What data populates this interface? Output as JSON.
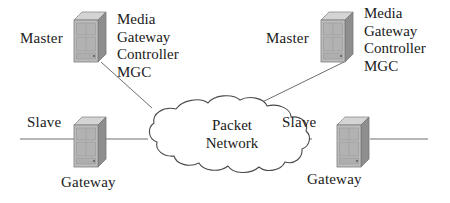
{
  "diagram": {
    "background": "#ffffff",
    "line_color": "#6b6b6b",
    "text_color": "#202020",
    "device_color_front": "#b9b9b9",
    "device_color_side": "#8f8f8f",
    "device_color_top": "#d6d6d6"
  },
  "nodes": {
    "mgc_left": {
      "role_label": "Master",
      "name_lines": [
        "Media",
        "Gateway",
        "Controller",
        "MGC"
      ],
      "icon": "server-cabinet-icon"
    },
    "mgc_right": {
      "role_label": "Master",
      "name_lines": [
        "Media",
        "Gateway",
        "Controller",
        "MGC"
      ],
      "icon": "server-cabinet-icon"
    },
    "gateway_left": {
      "role_label": "Slave",
      "name": "Gateway",
      "icon": "server-cabinet-icon"
    },
    "gateway_right": {
      "role_label": "Slave",
      "name": "Gateway",
      "icon": "server-cabinet-icon"
    },
    "cloud": {
      "name_lines": [
        "Packet",
        "Network"
      ],
      "icon": "cloud-icon"
    }
  },
  "links": [
    {
      "name": "mgc-left-to-cloud",
      "from": "mgc_left",
      "to": "cloud",
      "style": "solid"
    },
    {
      "name": "mgc-right-to-cloud",
      "from": "mgc_right",
      "to": "cloud",
      "style": "solid"
    },
    {
      "name": "gateway-left-to-cloud",
      "from": "gateway_left",
      "to": "cloud",
      "style": "solid"
    },
    {
      "name": "gateway-right-to-cloud",
      "from": "gateway_right",
      "to": "cloud",
      "style": "solid"
    },
    {
      "name": "gateway-left-access-line",
      "from": "edge-left",
      "to": "gateway_left",
      "style": "solid"
    },
    {
      "name": "gateway-right-access-line",
      "from": "gateway_right",
      "to": "edge-right",
      "style": "solid"
    }
  ]
}
